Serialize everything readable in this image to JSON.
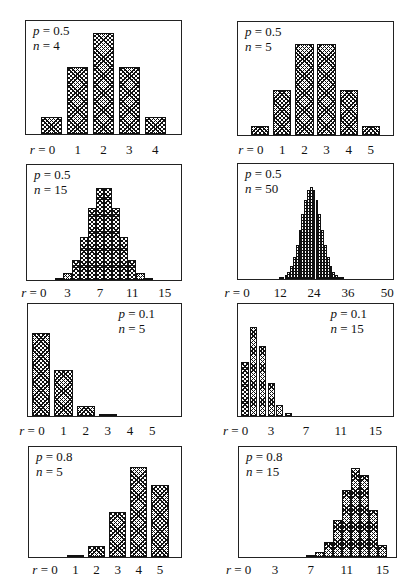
{
  "chart_data": [
    {
      "type": "bar",
      "title": "Binomial distribution",
      "p": "0.5",
      "n": "4",
      "param_position": "top-left",
      "xlabel": "r",
      "categories": [
        0,
        1,
        2,
        3,
        4
      ],
      "values": [
        0.0625,
        0.25,
        0.375,
        0.25,
        0.0625
      ],
      "tick_labels": [
        {
          "r": 0,
          "text": "r = 0"
        },
        {
          "r": 1,
          "text": "1"
        },
        {
          "r": 2,
          "text": "2"
        },
        {
          "r": 3,
          "text": "3"
        },
        {
          "r": 4,
          "text": "4"
        }
      ],
      "xlim": [
        -1,
        5
      ],
      "ymax": 0.42
    },
    {
      "type": "bar",
      "title": "Binomial distribution",
      "p": "0.5",
      "n": "5",
      "param_position": "top-left",
      "xlabel": "r",
      "categories": [
        0,
        1,
        2,
        3,
        4,
        5
      ],
      "values": [
        0.03125,
        0.15625,
        0.3125,
        0.3125,
        0.15625,
        0.03125
      ],
      "tick_labels": [
        {
          "r": 0,
          "text": "r = 0"
        },
        {
          "r": 1,
          "text": "1"
        },
        {
          "r": 2,
          "text": "2"
        },
        {
          "r": 3,
          "text": "3"
        },
        {
          "r": 4,
          "text": "4"
        },
        {
          "r": 5,
          "text": "5"
        }
      ],
      "xlim": [
        -1,
        6
      ],
      "ymax": 0.39
    },
    {
      "type": "bar",
      "title": "Binomial distribution",
      "p": "0.5",
      "n": "15",
      "param_position": "top-left",
      "xlabel": "r",
      "categories": [
        0,
        1,
        2,
        3,
        4,
        5,
        6,
        7,
        8,
        9,
        10,
        11,
        12,
        13,
        14,
        15
      ],
      "values": [
        3e-05,
        0.0005,
        0.0032,
        0.0139,
        0.0417,
        0.0916,
        0.1527,
        0.1964,
        0.1964,
        0.1527,
        0.0916,
        0.0417,
        0.0139,
        0.0032,
        0.0005,
        3e-05
      ],
      "tick_labels": [
        {
          "r": 0,
          "text": "r = 0"
        },
        {
          "r": 3,
          "text": "3"
        },
        {
          "r": 7,
          "text": "7"
        },
        {
          "r": 11,
          "text": "11"
        },
        {
          "r": 15,
          "text": "15"
        }
      ],
      "xlim": [
        -2,
        17
      ],
      "ymax": 0.245
    },
    {
      "type": "bar",
      "title": "Binomial distribution",
      "p": "0.5",
      "n": "50",
      "param_position": "top-left",
      "xlabel": "r",
      "categories": [
        12,
        13,
        14,
        15,
        16,
        17,
        18,
        19,
        20,
        21,
        22,
        23,
        24,
        25,
        26,
        27,
        28,
        29,
        30,
        31,
        32,
        33,
        34,
        35,
        36,
        37,
        38
      ],
      "values": [
        0.0008,
        0.0019,
        0.0044,
        0.0087,
        0.016,
        0.027,
        0.0419,
        0.0598,
        0.0788,
        0.096,
        0.108,
        0.1123,
        0.108,
        0.096,
        0.0788,
        0.0598,
        0.0419,
        0.027,
        0.016,
        0.0087,
        0.0044,
        0.0019,
        0.0008,
        0.0003,
        0.0001,
        3e-05,
        1e-05
      ],
      "tick_labels": [
        {
          "r": 0,
          "text": "r = 0"
        },
        {
          "r": 12,
          "text": "12"
        },
        {
          "r": 24,
          "text": "24"
        },
        {
          "r": 36,
          "text": "36"
        },
        {
          "r": 50,
          "text": "50"
        }
      ],
      "xlim": [
        -3,
        52
      ],
      "ymax": 0.14
    },
    {
      "type": "bar",
      "title": "Binomial distribution",
      "p": "0.1",
      "n": "5",
      "param_position": "top-right",
      "xlabel": "r",
      "categories": [
        0,
        1,
        2,
        3,
        4,
        5
      ],
      "values": [
        0.5905,
        0.3281,
        0.0729,
        0.0081,
        0.00045,
        1e-05
      ],
      "tick_labels": [
        {
          "r": 0,
          "text": "r = 0"
        },
        {
          "r": 1,
          "text": "1"
        },
        {
          "r": 2,
          "text": "2"
        },
        {
          "r": 3,
          "text": "3"
        },
        {
          "r": 4,
          "text": "4"
        },
        {
          "r": 5,
          "text": "5"
        }
      ],
      "xlim": [
        -0.6,
        6.3
      ],
      "ymax": 0.8
    },
    {
      "type": "bar",
      "title": "Binomial distribution",
      "p": "0.1",
      "n": "15",
      "param_position": "top-right",
      "xlabel": "r",
      "categories": [
        0,
        1,
        2,
        3,
        4,
        5,
        6,
        7
      ],
      "values": [
        0.2059,
        0.3432,
        0.2669,
        0.1285,
        0.0428,
        0.0105,
        0.0019,
        0.0003
      ],
      "tick_labels": [
        {
          "r": 0,
          "text": "r = 0"
        },
        {
          "r": 3,
          "text": "3"
        },
        {
          "r": 7,
          "text": "7"
        },
        {
          "r": 11,
          "text": "11"
        },
        {
          "r": 15,
          "text": "15"
        }
      ],
      "xlim": [
        -0.8,
        17
      ],
      "ymax": 0.43
    },
    {
      "type": "bar",
      "title": "Binomial distribution",
      "p": "0.8",
      "n": "5",
      "param_position": "top-left",
      "xlabel": "r",
      "categories": [
        0,
        1,
        2,
        3,
        4,
        5
      ],
      "values": [
        0.00032,
        0.0064,
        0.0512,
        0.2048,
        0.4096,
        0.32768
      ],
      "tick_labels": [
        {
          "r": 0,
          "text": "r = 0"
        },
        {
          "r": 1,
          "text": "1"
        },
        {
          "r": 2,
          "text": "2"
        },
        {
          "r": 3,
          "text": "3"
        },
        {
          "r": 4,
          "text": "4"
        },
        {
          "r": 5,
          "text": "5"
        }
      ],
      "xlim": [
        -1.2,
        6
      ],
      "ymax": 0.5
    },
    {
      "type": "bar",
      "title": "Binomial distribution",
      "p": "0.8",
      "n": "15",
      "param_position": "top-left",
      "xlabel": "r",
      "categories": [
        6,
        7,
        8,
        9,
        10,
        11,
        12,
        13,
        14,
        15
      ],
      "values": [
        0.0007,
        0.0035,
        0.0138,
        0.043,
        0.1032,
        0.1876,
        0.2501,
        0.2309,
        0.1319,
        0.0352
      ],
      "tick_labels": [
        {
          "r": 0,
          "text": "r = 0"
        },
        {
          "r": 3,
          "text": "3"
        },
        {
          "r": 7,
          "text": "7"
        },
        {
          "r": 11,
          "text": "11"
        },
        {
          "r": 15,
          "text": "15"
        }
      ],
      "xlim": [
        -1,
        16.5
      ],
      "ymax": 0.31
    }
  ],
  "labels": {
    "p_prefix": "p = ",
    "n_prefix": "n = "
  }
}
